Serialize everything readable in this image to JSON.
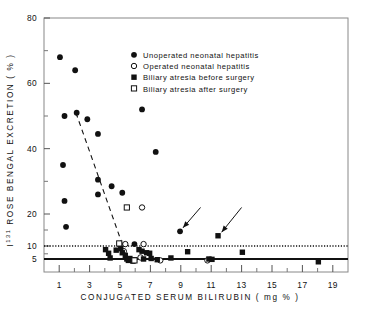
{
  "chart_data": {
    "type": "scatter",
    "title": "",
    "xlabel": "CONJUGATED  SERUM  BILIRUBIN   ( mg % )",
    "ylabel": "I131 ROSE BENGAL EXCRETION ( % )",
    "ylabel_base": "I",
    "ylabel_sup": "131",
    "ylabel_rest": " ROSE BENGAL EXCRETION ( % )",
    "xlim": [
      0,
      20
    ],
    "ylim": [
      3,
      80
    ],
    "xticks": [
      1,
      3,
      5,
      7,
      9,
      11,
      13,
      15,
      17,
      19
    ],
    "xtick_labels": [
      "1",
      "3",
      "5",
      "7",
      "9",
      "11",
      "13",
      "15",
      "17",
      "19"
    ],
    "xticks_minor": [
      2,
      4,
      6,
      8,
      10,
      12,
      14,
      16,
      18
    ],
    "yticks": [
      80,
      60,
      40,
      20,
      10,
      5
    ],
    "ytick_labels": [
      "80",
      "60",
      "40",
      "20",
      "10",
      "5"
    ],
    "yticks_minor": [
      70,
      50,
      30,
      15,
      7
    ],
    "grid": false,
    "legend_position": "top-center",
    "reference_lines": [
      {
        "name": "upper-threshold",
        "y": 10,
        "style": "dotted",
        "color": "#111111"
      },
      {
        "name": "lower-threshold",
        "y": 5,
        "style": "solid",
        "color": "#111111"
      }
    ],
    "trend_line": {
      "name": "regression-dashed",
      "style": "dashed",
      "x1": 2.1,
      "y1": 51.0,
      "x2": 5.3,
      "y2": 8.2
    },
    "annotations": [
      {
        "name": "arrow-1",
        "x_tail": 10.3,
        "y_tail": 22.0,
        "x_head": 8.95,
        "y_head": 14.6
      },
      {
        "name": "arrow-2",
        "x_tail": 13.0,
        "y_tail": 22.0,
        "x_head": 11.5,
        "y_head": 13.2
      }
    ],
    "series": [
      {
        "name": "Unoperated neonatal hepatitis",
        "marker": "filled-circle",
        "color": "#111111",
        "points": [
          [
            1.05,
            68.0
          ],
          [
            2.05,
            64.0
          ],
          [
            1.35,
            50.0
          ],
          [
            2.15,
            51.0
          ],
          [
            2.85,
            49.0
          ],
          [
            3.55,
            44.5
          ],
          [
            6.45,
            52.0
          ],
          [
            7.35,
            39.0
          ],
          [
            1.25,
            35.0
          ],
          [
            1.35,
            24.0
          ],
          [
            1.45,
            16.0
          ],
          [
            3.55,
            30.5
          ],
          [
            3.55,
            26.0
          ],
          [
            4.45,
            28.5
          ],
          [
            5.15,
            26.5
          ],
          [
            5.95,
            10.6
          ],
          [
            8.95,
            14.6
          ]
        ]
      },
      {
        "name": "Operated neonatal hepatitis",
        "marker": "open-circle",
        "color": "#111111",
        "points": [
          [
            5.35,
            10.6
          ],
          [
            6.55,
            10.6
          ],
          [
            6.45,
            22.0
          ],
          [
            5.25,
            8.0
          ],
          [
            6.35,
            5.6
          ],
          [
            7.65,
            4.6
          ],
          [
            10.75,
            4.6
          ]
        ]
      },
      {
        "name": "Biliary atresia before surgery",
        "marker": "filled-square",
        "color": "#111111",
        "points": [
          [
            4.05,
            8.6
          ],
          [
            4.25,
            7.2
          ],
          [
            4.35,
            5.4
          ],
          [
            4.75,
            8.4
          ],
          [
            5.05,
            9.0
          ],
          [
            5.15,
            7.4
          ],
          [
            5.35,
            6.4
          ],
          [
            5.45,
            5.0
          ],
          [
            5.55,
            4.6
          ],
          [
            5.65,
            5.2
          ],
          [
            5.85,
            4.4
          ],
          [
            5.95,
            4.8
          ],
          [
            6.25,
            8.6
          ],
          [
            6.45,
            8.0
          ],
          [
            6.55,
            5.0
          ],
          [
            6.75,
            7.4
          ],
          [
            6.95,
            7.2
          ],
          [
            7.05,
            5.2
          ],
          [
            7.45,
            4.8
          ],
          [
            8.35,
            5.4
          ],
          [
            9.45,
            7.8
          ],
          [
            10.85,
            5.0
          ],
          [
            11.05,
            4.9
          ],
          [
            11.45,
            13.2
          ],
          [
            13.05,
            7.6
          ],
          [
            18.05,
            4.2
          ]
        ]
      },
      {
        "name": "Biliary atresia after surgery",
        "marker": "open-square",
        "color": "#111111",
        "points": [
          [
            5.45,
            22.0
          ],
          [
            4.95,
            10.8
          ],
          [
            5.95,
            4.6
          ]
        ]
      }
    ]
  },
  "legend": {
    "entries": [
      {
        "marker": "filled-circle",
        "label": "Unoperated neonatal hepatitis"
      },
      {
        "marker": "open-circle",
        "label": "Operated  neonatal  hepatitis"
      },
      {
        "marker": "filled-square",
        "label": "Biliary atresia before surgery"
      },
      {
        "marker": "open-square",
        "label": "Biliary atresia after surgery"
      }
    ]
  }
}
